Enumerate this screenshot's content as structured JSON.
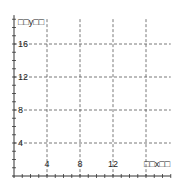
{
  "chart_data": {
    "type": "line",
    "title": "",
    "xlabel": "□□x□□",
    "ylabel": "□□y□□",
    "xlim": [
      0,
      19
    ],
    "ylim": [
      0,
      19.5
    ],
    "x_ticks": [
      4,
      8,
      12
    ],
    "x_tick_labels": [
      "4",
      "8",
      "12"
    ],
    "x_gridlines": [
      4,
      8,
      12,
      16
    ],
    "y_ticks": [
      4,
      8,
      12,
      16
    ],
    "y_tick_labels": [
      "4",
      "8",
      "12",
      "16"
    ],
    "y_gridlines": [
      4,
      8,
      12,
      16
    ],
    "minor_tick_step": 1,
    "grid": true,
    "grid_style": "dashed",
    "series": [],
    "legend": null
  },
  "colors": {
    "axis": "#333333",
    "grid": "#555555",
    "text": "#222222",
    "background": "#ffffff"
  }
}
